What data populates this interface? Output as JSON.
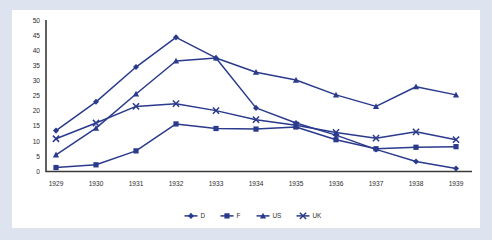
{
  "chart_data": {
    "type": "line",
    "title": "",
    "xlabel": "",
    "ylabel": "",
    "grid": false,
    "legend_position": "bottom",
    "categories": [
      "1929",
      "1930",
      "1931",
      "1932",
      "1933",
      "1934",
      "1935",
      "1936",
      "1937",
      "1938",
      "1939"
    ],
    "x": [
      1929,
      1930,
      1931,
      1932,
      1933,
      1934,
      1935,
      1936,
      1937,
      1938,
      1939
    ],
    "ylim": [
      0,
      50
    ],
    "yticks": [
      0,
      5,
      10,
      15,
      20,
      25,
      30,
      35,
      40,
      45,
      50
    ],
    "ytick_labels": [
      "0",
      "5",
      "10",
      "15",
      "20",
      "25",
      "30",
      "35",
      "40",
      "45",
      "50"
    ],
    "series": [
      {
        "name": "D",
        "marker": "diamond",
        "color": "#2a3a8c",
        "values": [
          13.5,
          23.0,
          34.5,
          44.3,
          37.5,
          21.0,
          16.0,
          12.0,
          7.3,
          3.3,
          1.0
        ]
      },
      {
        "name": "F",
        "marker": "square",
        "color": "#2a3a8c",
        "values": [
          1.3,
          2.2,
          6.8,
          15.7,
          14.2,
          14.0,
          14.7,
          10.5,
          7.5,
          8.0,
          8.2
        ]
      },
      {
        "name": "US",
        "marker": "triangle",
        "color": "#2a3a8c",
        "values": [
          5.5,
          14.3,
          25.6,
          36.5,
          37.5,
          32.8,
          30.2,
          25.3,
          21.5,
          28.0,
          25.3
        ]
      },
      {
        "name": "UK",
        "marker": "cross",
        "color": "#2a3a8c",
        "values": [
          10.8,
          16.0,
          21.5,
          22.4,
          20.1,
          17.1,
          15.3,
          12.9,
          11.0,
          13.1,
          10.5
        ]
      }
    ]
  },
  "style": {
    "frame_background": "#dde4f0",
    "plot_background": "#ffffff",
    "axis_color": "#3a3a3a",
    "series_color": "#2a3a8c"
  }
}
